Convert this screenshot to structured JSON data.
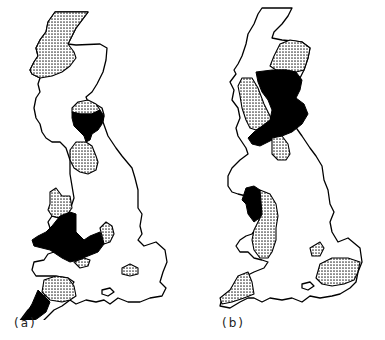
{
  "figure": {
    "panels": [
      {
        "id": "a",
        "label": "(a)",
        "description": "Outline map of Great Britain with dotted (stippled) and solid black shaded regions",
        "regions": {
          "dotted": [
            "northwest-scotland",
            "southern-uplands-east",
            "northwest-england",
            "north-wales",
            "welsh-borders-east",
            "severn",
            "south-central-england",
            "devon"
          ],
          "black": [
            "scottish-borders",
            "wales-south",
            "cornwall"
          ]
        }
      },
      {
        "id": "b",
        "label": "(b)",
        "description": "Outline map of Great Britain with dotted (stippled) and solid black shaded regions",
        "regions": {
          "dotted": [
            "northeast-scotland",
            "southwest-scotland",
            "northern-england-east",
            "wales-east",
            "south-central-england",
            "southeast-england",
            "cornwall"
          ],
          "black": [
            "central-scotland-and-borders",
            "north-wales"
          ]
        }
      }
    ],
    "legend_styles": {
      "dotted": "#9a9a9a",
      "black": "#000000",
      "outline": "#000000"
    }
  }
}
